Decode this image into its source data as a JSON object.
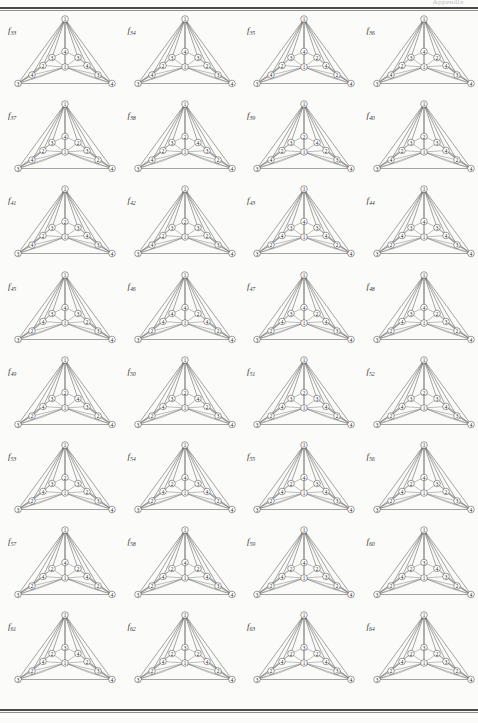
{
  "page": {
    "folio": "Appendix",
    "rule_color": "#4a4a4a",
    "background": "#fbfbfa",
    "columns": 4,
    "rows": 8
  },
  "figure_label_prefix": "f",
  "graph_layout": {
    "description": "Triangular planar graph, 11 labelled vertices",
    "positions": {
      "apex": [
        53.0,
        6.0
      ],
      "left_base": [
        6.0,
        70.5
      ],
      "right_base": [
        100.0,
        70.5
      ],
      "center": [
        53.0,
        54.0
      ],
      "top_mid": [
        53.0,
        38.5
      ],
      "upper_left": [
        40.0,
        44.5
      ],
      "upper_right": [
        66.0,
        44.5
      ],
      "mid_left": [
        31.0,
        52.5
      ],
      "mid_right": [
        75.0,
        52.5
      ],
      "low_left": [
        20.0,
        62.0
      ],
      "low_right": [
        86.0,
        62.0
      ]
    },
    "edges": [
      [
        "apex",
        "left_base"
      ],
      [
        "apex",
        "right_base"
      ],
      [
        "apex",
        "center"
      ],
      [
        "apex",
        "top_mid"
      ],
      [
        "apex",
        "upper_left"
      ],
      [
        "apex",
        "upper_right"
      ],
      [
        "apex",
        "mid_left"
      ],
      [
        "apex",
        "mid_right"
      ],
      [
        "apex",
        "low_left"
      ],
      [
        "apex",
        "low_right"
      ],
      [
        "left_base",
        "right_base"
      ],
      [
        "left_base",
        "low_left"
      ],
      [
        "left_base",
        "mid_left"
      ],
      [
        "left_base",
        "center"
      ],
      [
        "left_base",
        "upper_left"
      ],
      [
        "right_base",
        "low_right"
      ],
      [
        "right_base",
        "mid_right"
      ],
      [
        "right_base",
        "center"
      ],
      [
        "right_base",
        "upper_right"
      ],
      [
        "low_left",
        "mid_left"
      ],
      [
        "low_left",
        "center"
      ],
      [
        "low_right",
        "mid_right"
      ],
      [
        "low_right",
        "center"
      ],
      [
        "mid_left",
        "upper_left"
      ],
      [
        "mid_left",
        "center"
      ],
      [
        "mid_right",
        "upper_right"
      ],
      [
        "mid_right",
        "center"
      ],
      [
        "upper_left",
        "top_mid"
      ],
      [
        "upper_left",
        "center"
      ],
      [
        "upper_right",
        "top_mid"
      ],
      [
        "upper_right",
        "center"
      ],
      [
        "top_mid",
        "center"
      ]
    ]
  },
  "figures": [
    {
      "index": "33",
      "labels": {
        "apex": "1",
        "left_base": "3",
        "right_base": "4",
        "center": "1",
        "top_mid": "4",
        "upper_left": "3",
        "upper_right": "3",
        "mid_left": "2",
        "mid_right": "4",
        "low_left": "4",
        "low_right": "3"
      }
    },
    {
      "index": "34",
      "labels": {
        "apex": "1",
        "left_base": "3",
        "right_base": "4",
        "center": "1",
        "top_mid": "4",
        "upper_left": "3",
        "upper_right": "3",
        "mid_left": "2",
        "mid_right": "2",
        "low_left": "4",
        "low_right": "3"
      }
    },
    {
      "index": "35",
      "labels": {
        "apex": "1",
        "left_base": "3",
        "right_base": "4",
        "center": "1",
        "top_mid": "4",
        "upper_left": "3",
        "upper_right": "2",
        "mid_left": "2",
        "mid_right": "4",
        "low_left": "4",
        "low_right": "2"
      }
    },
    {
      "index": "36",
      "labels": {
        "apex": "1",
        "left_base": "3",
        "right_base": "4",
        "center": "1",
        "top_mid": "4",
        "upper_left": "3",
        "upper_right": "2",
        "mid_left": "2",
        "mid_right": "4",
        "low_left": "4",
        "low_right": "3"
      }
    },
    {
      "index": "37",
      "labels": {
        "apex": "1",
        "left_base": "3",
        "right_base": "4",
        "center": "1",
        "top_mid": "4",
        "upper_left": "3",
        "upper_right": "2",
        "mid_left": "2",
        "mid_right": "3",
        "low_left": "4",
        "low_right": "2"
      }
    },
    {
      "index": "38",
      "labels": {
        "apex": "1",
        "left_base": "3",
        "right_base": "4",
        "center": "1",
        "top_mid": "2",
        "upper_left": "3",
        "upper_right": "4",
        "mid_left": "2",
        "mid_right": "3",
        "low_left": "4",
        "low_right": "2"
      }
    },
    {
      "index": "39",
      "labels": {
        "apex": "1",
        "left_base": "3",
        "right_base": "4",
        "center": "1",
        "top_mid": "2",
        "upper_left": "3",
        "upper_right": "4",
        "mid_left": "2",
        "mid_right": "2",
        "low_left": "4",
        "low_right": "3"
      }
    },
    {
      "index": "40",
      "labels": {
        "apex": "1",
        "left_base": "3",
        "right_base": "4",
        "center": "1",
        "top_mid": "2",
        "upper_left": "3",
        "upper_right": "3",
        "mid_left": "2",
        "mid_right": "4",
        "low_left": "4",
        "low_right": "2"
      }
    },
    {
      "index": "41",
      "labels": {
        "apex": "1",
        "left_base": "3",
        "right_base": "4",
        "center": "1",
        "top_mid": "2",
        "upper_left": "3",
        "upper_right": "3",
        "mid_left": "2",
        "mid_right": "4",
        "low_left": "4",
        "low_right": "3"
      }
    },
    {
      "index": "42",
      "labels": {
        "apex": "1",
        "left_base": "3",
        "right_base": "4",
        "center": "1",
        "top_mid": "2",
        "upper_left": "3",
        "upper_right": "3",
        "mid_left": "2",
        "mid_right": "2",
        "low_left": "4",
        "low_right": "3"
      }
    },
    {
      "index": "43",
      "labels": {
        "apex": "1",
        "left_base": "3",
        "right_base": "4",
        "center": "1",
        "top_mid": "4",
        "upper_left": "3",
        "upper_right": "3",
        "mid_left": "4",
        "mid_right": "4",
        "low_left": "2",
        "low_right": "2"
      }
    },
    {
      "index": "44",
      "labels": {
        "apex": "1",
        "left_base": "3",
        "right_base": "4",
        "center": "1",
        "top_mid": "4",
        "upper_left": "3",
        "upper_right": "3",
        "mid_left": "4",
        "mid_right": "4",
        "low_left": "2",
        "low_right": "3"
      }
    },
    {
      "index": "45",
      "labels": {
        "apex": "1",
        "left_base": "3",
        "right_base": "4",
        "center": "1",
        "top_mid": "4",
        "upper_left": "3",
        "upper_right": "3",
        "mid_left": "4",
        "mid_right": "2",
        "low_left": "2",
        "low_right": "3"
      }
    },
    {
      "index": "46",
      "labels": {
        "apex": "1",
        "left_base": "3",
        "right_base": "4",
        "center": "1",
        "top_mid": "4",
        "upper_left": "4",
        "upper_right": "2",
        "mid_left": "4",
        "mid_right": "4",
        "low_left": "2",
        "low_right": "2"
      }
    },
    {
      "index": "47",
      "labels": {
        "apex": "1",
        "left_base": "3",
        "right_base": "4",
        "center": "1",
        "top_mid": "4",
        "upper_left": "3",
        "upper_right": "2",
        "mid_left": "4",
        "mid_right": "4",
        "low_left": "2",
        "low_right": "3"
      }
    },
    {
      "index": "48",
      "labels": {
        "apex": "1",
        "left_base": "3",
        "right_base": "4",
        "center": "1",
        "top_mid": "4",
        "upper_left": "3",
        "upper_right": "2",
        "mid_left": "4",
        "mid_right": "3",
        "low_left": "2",
        "low_right": "2"
      }
    },
    {
      "index": "49",
      "labels": {
        "apex": "1",
        "left_base": "3",
        "right_base": "4",
        "center": "1",
        "top_mid": "2",
        "upper_left": "3",
        "upper_right": "4",
        "mid_left": "4",
        "mid_right": "3",
        "low_left": "2",
        "low_right": "2"
      }
    },
    {
      "index": "50",
      "labels": {
        "apex": "1",
        "left_base": "3",
        "right_base": "4",
        "center": "1",
        "top_mid": "2",
        "upper_left": "3",
        "upper_right": "4",
        "mid_left": "4",
        "mid_right": "2",
        "low_left": "2",
        "low_right": "3"
      }
    },
    {
      "index": "51",
      "labels": {
        "apex": "1",
        "left_base": "3",
        "right_base": "4",
        "center": "1",
        "top_mid": "2",
        "upper_left": "3",
        "upper_right": "3",
        "mid_left": "4",
        "mid_right": "4",
        "low_left": "2",
        "low_right": "2"
      }
    },
    {
      "index": "52",
      "labels": {
        "apex": "1",
        "left_base": "3",
        "right_base": "4",
        "center": "1",
        "top_mid": "2",
        "upper_left": "3",
        "upper_right": "3",
        "mid_left": "4",
        "mid_right": "4",
        "low_left": "2",
        "low_right": "3"
      }
    },
    {
      "index": "53",
      "labels": {
        "apex": "1",
        "left_base": "3",
        "right_base": "4",
        "center": "1",
        "top_mid": "2",
        "upper_left": "3",
        "upper_right": "3",
        "mid_left": "4",
        "mid_right": "2",
        "low_left": "2",
        "low_right": "3"
      }
    },
    {
      "index": "54",
      "labels": {
        "apex": "1",
        "left_base": "3",
        "right_base": "4",
        "center": "1",
        "top_mid": "4",
        "upper_left": "2",
        "upper_right": "3",
        "mid_left": "4",
        "mid_right": "4",
        "low_left": "2",
        "low_right": "2"
      }
    },
    {
      "index": "55",
      "labels": {
        "apex": "1",
        "left_base": "3",
        "right_base": "4",
        "center": "1",
        "top_mid": "4",
        "upper_left": "2",
        "upper_right": "3",
        "mid_left": "4",
        "mid_right": "4",
        "low_left": "2",
        "low_right": "3"
      }
    },
    {
      "index": "56",
      "labels": {
        "apex": "1",
        "left_base": "3",
        "right_base": "4",
        "center": "1",
        "top_mid": "4",
        "upper_left": "2",
        "upper_right": "3",
        "mid_left": "4",
        "mid_right": "2",
        "low_left": "2",
        "low_right": "3"
      }
    },
    {
      "index": "57",
      "labels": {
        "apex": "1",
        "left_base": "3",
        "right_base": "4",
        "center": "1",
        "top_mid": "4",
        "upper_left": "2",
        "upper_right": "2",
        "mid_left": "4",
        "mid_right": "4",
        "low_left": "2",
        "low_right": "2"
      }
    },
    {
      "index": "58",
      "labels": {
        "apex": "1",
        "left_base": "3",
        "right_base": "4",
        "center": "1",
        "top_mid": "4",
        "upper_left": "2",
        "upper_right": "2",
        "mid_left": "4",
        "mid_right": "4",
        "low_left": "2",
        "low_right": "3"
      }
    },
    {
      "index": "59",
      "labels": {
        "apex": "1",
        "left_base": "3",
        "right_base": "4",
        "center": "1",
        "top_mid": "4",
        "upper_left": "2",
        "upper_right": "2",
        "mid_left": "4",
        "mid_right": "3",
        "low_left": "2",
        "low_right": "2"
      }
    },
    {
      "index": "60",
      "labels": {
        "apex": "1",
        "left_base": "3",
        "right_base": "4",
        "center": "1",
        "top_mid": "3",
        "upper_left": "2",
        "upper_right": "4",
        "mid_left": "4",
        "mid_right": "3",
        "low_left": "2",
        "low_right": "2"
      }
    },
    {
      "index": "61",
      "labels": {
        "apex": "1",
        "left_base": "3",
        "right_base": "4",
        "center": "1",
        "top_mid": "3",
        "upper_left": "2",
        "upper_right": "4",
        "mid_left": "4",
        "mid_right": "2",
        "low_left": "2",
        "low_right": "3"
      }
    },
    {
      "index": "62",
      "labels": {
        "apex": "1",
        "left_base": "3",
        "right_base": "4",
        "center": "1",
        "top_mid": "3",
        "upper_left": "2",
        "upper_right": "2",
        "mid_left": "4",
        "mid_right": "4",
        "low_left": "2",
        "low_right": "2"
      }
    },
    {
      "index": "63",
      "labels": {
        "apex": "1",
        "left_base": "3",
        "right_base": "4",
        "center": "1",
        "top_mid": "3",
        "upper_left": "2",
        "upper_right": "2",
        "mid_left": "4",
        "mid_right": "4",
        "low_left": "2",
        "low_right": "3"
      }
    },
    {
      "index": "64",
      "labels": {
        "apex": "1",
        "left_base": "3",
        "right_base": "4",
        "center": "1",
        "top_mid": "3",
        "upper_left": "2",
        "upper_right": "2",
        "mid_left": "4",
        "mid_right": "3",
        "low_left": "2",
        "low_right": "2"
      }
    }
  ]
}
